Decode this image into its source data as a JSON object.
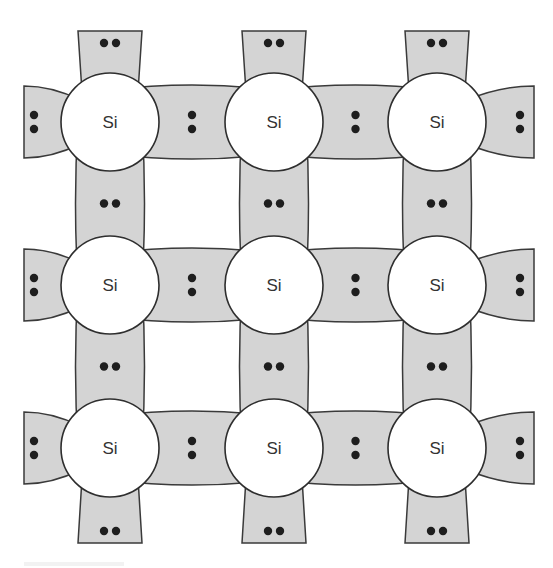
{
  "diagram": {
    "type": "covalent-bond-lattice",
    "atom_label": "Si",
    "rows": 3,
    "cols": 3,
    "atoms": [
      {
        "row": 0,
        "col": 0,
        "label": "Si",
        "cx": 110,
        "cy": 122
      },
      {
        "row": 0,
        "col": 1,
        "label": "Si",
        "cx": 274,
        "cy": 122
      },
      {
        "row": 0,
        "col": 2,
        "label": "Si",
        "cx": 437,
        "cy": 122
      },
      {
        "row": 1,
        "col": 0,
        "label": "Si",
        "cx": 110,
        "cy": 285
      },
      {
        "row": 1,
        "col": 1,
        "label": "Si",
        "cx": 274,
        "cy": 285
      },
      {
        "row": 1,
        "col": 2,
        "label": "Si",
        "cx": 437,
        "cy": 285
      },
      {
        "row": 2,
        "col": 0,
        "label": "Si",
        "cx": 110,
        "cy": 448
      },
      {
        "row": 2,
        "col": 1,
        "label": "Si",
        "cx": 274,
        "cy": 448
      },
      {
        "row": 2,
        "col": 2,
        "label": "Si",
        "cx": 437,
        "cy": 448
      }
    ],
    "atom_radius": 49,
    "electrons_per_bond": 2,
    "colors": {
      "bond_fill": "#d4d4d4",
      "outline": "#3a3a3a",
      "atom_fill": "#ffffff",
      "electron": "#1e1e1e"
    }
  }
}
